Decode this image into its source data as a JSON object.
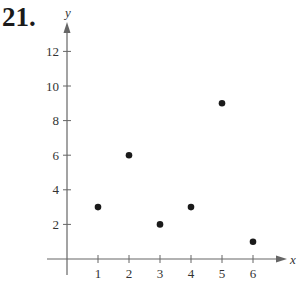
{
  "problem_number": "21.",
  "chart_data": {
    "type": "scatter",
    "title": "",
    "xlabel": "x",
    "ylabel": "y",
    "x": [
      1,
      2,
      3,
      4,
      5,
      6
    ],
    "y": [
      3,
      6,
      2,
      3,
      9,
      1
    ],
    "points": [
      [
        1,
        3
      ],
      [
        2,
        6
      ],
      [
        3,
        2
      ],
      [
        4,
        3
      ],
      [
        5,
        9
      ],
      [
        6,
        1
      ]
    ],
    "x_ticks": [
      1,
      2,
      3,
      4,
      5,
      6
    ],
    "y_ticks": [
      2,
      4,
      6,
      8,
      10,
      12
    ],
    "x_tick_labels": [
      "1",
      "2",
      "3",
      "4",
      "5",
      "6"
    ],
    "y_tick_labels": [
      "2",
      "4",
      "6",
      "8",
      "10",
      "12"
    ],
    "xlim": [
      -0.5,
      6.8
    ],
    "ylim": [
      -0.8,
      12.5
    ],
    "grid": false,
    "legend": null,
    "marker_color": "#1a1a1a",
    "axis_color": "#666666"
  }
}
